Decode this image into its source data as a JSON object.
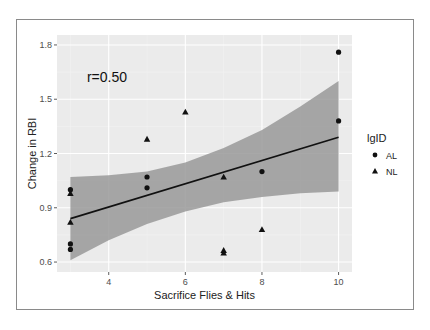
{
  "chart_data": {
    "type": "scatter",
    "title": "",
    "xlabel": "Sacrifice Flies & Hits",
    "ylabel": "Change in RBI",
    "xlim": [
      2.65,
      10.35
    ],
    "ylim": [
      0.545,
      1.855
    ],
    "x_ticks": [
      4,
      6,
      8,
      10
    ],
    "x_tick_labels": [
      "4",
      "6",
      "8",
      "10"
    ],
    "y_ticks": [
      0.6,
      0.9,
      1.2,
      1.5,
      1.8
    ],
    "y_tick_labels": [
      "0.6",
      "0.9",
      "1.2",
      "1.5",
      "1.8"
    ],
    "grid": true,
    "legend": {
      "title": "lgID",
      "position": "right",
      "entries": [
        {
          "label": "AL",
          "shape": "circle"
        },
        {
          "label": "NL",
          "shape": "triangle"
        }
      ]
    },
    "annotation": {
      "text": "r=0.50",
      "x": 3.9,
      "y": 1.62
    },
    "series": [
      {
        "name": "AL",
        "shape": "circle",
        "points": [
          {
            "x": 3,
            "y": 1.0
          },
          {
            "x": 3,
            "y": 0.7
          },
          {
            "x": 3,
            "y": 0.67
          },
          {
            "x": 5,
            "y": 1.07
          },
          {
            "x": 5,
            "y": 1.01
          },
          {
            "x": 8,
            "y": 1.1
          },
          {
            "x": 10,
            "y": 1.76
          },
          {
            "x": 10,
            "y": 1.38
          }
        ]
      },
      {
        "name": "NL",
        "shape": "triangle",
        "points": [
          {
            "x": 3,
            "y": 0.98
          },
          {
            "x": 3,
            "y": 0.82
          },
          {
            "x": 5,
            "y": 1.28
          },
          {
            "x": 6,
            "y": 1.43
          },
          {
            "x": 7,
            "y": 1.07
          },
          {
            "x": 7,
            "y": 0.665
          },
          {
            "x": 7,
            "y": 0.65
          },
          {
            "x": 8,
            "y": 0.78
          }
        ]
      }
    ],
    "regression": {
      "method": "lm",
      "line": [
        {
          "x": 3,
          "y": 0.84
        },
        {
          "x": 10,
          "y": 1.29
        }
      ],
      "confidence_band": {
        "x": [
          3,
          4,
          5,
          6,
          7,
          8,
          9,
          10
        ],
        "upper": [
          1.07,
          1.08,
          1.1,
          1.15,
          1.23,
          1.33,
          1.46,
          1.6
        ],
        "lower": [
          0.61,
          0.72,
          0.81,
          0.88,
          0.93,
          0.96,
          0.98,
          0.99
        ]
      }
    },
    "colors": {
      "panel_bg": "#ebebeb",
      "grid_major": "#ffffff",
      "grid_minor": "#f4f4f4",
      "band": "#999999",
      "line": "#111111",
      "points": "#111111"
    }
  }
}
